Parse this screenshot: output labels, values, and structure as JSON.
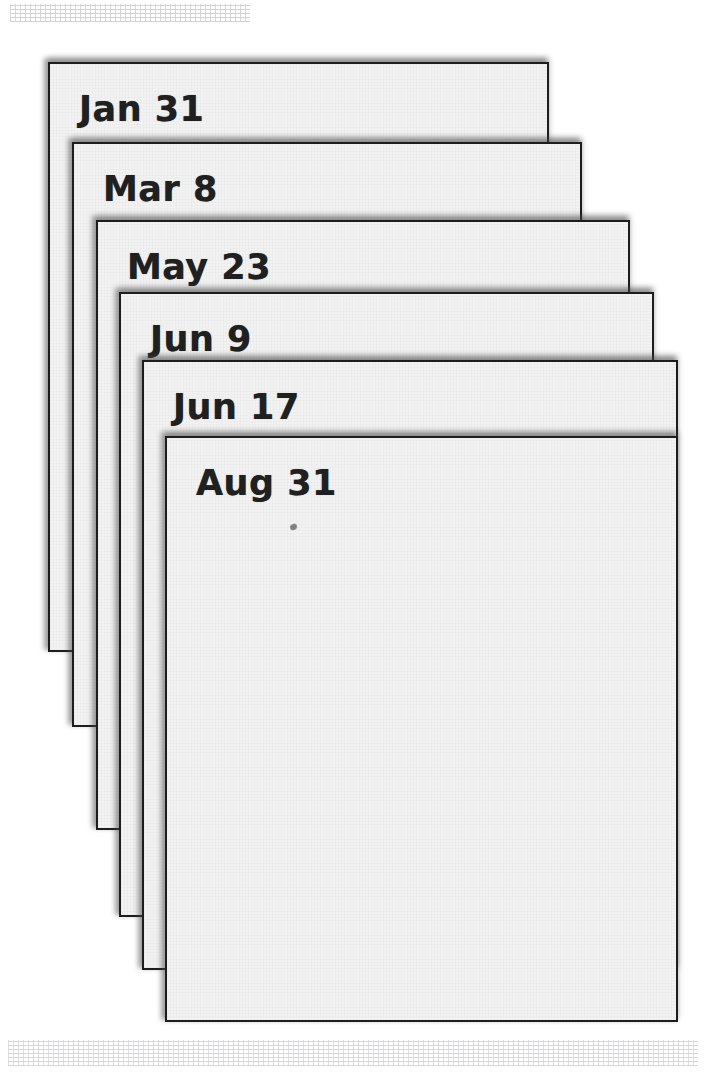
{
  "page": {
    "background_color": "#ffffff",
    "width": 715,
    "height": 1081
  },
  "style": {
    "card_fill": "#f2f2f2",
    "card_border_color": "#1d1d1d",
    "label_color": "#202020",
    "shadow_color": "#464646"
  },
  "stack": {
    "count": 6,
    "cards": [
      {
        "label": "Jan 31",
        "z": 1,
        "left": 48,
        "top": 62,
        "width": 501,
        "height": 590
      },
      {
        "label": "Mar 8",
        "z": 2,
        "left": 72,
        "top": 142,
        "width": 510,
        "height": 585
      },
      {
        "label": "May 23",
        "z": 3,
        "left": 96,
        "top": 220,
        "width": 534,
        "height": 610
      },
      {
        "label": "Jun 9",
        "z": 4,
        "left": 119,
        "top": 292,
        "width": 535,
        "height": 625
      },
      {
        "label": "Jun 17",
        "z": 5,
        "left": 142,
        "top": 360,
        "width": 536,
        "height": 610
      },
      {
        "label": "Aug 31",
        "z": 6,
        "left": 165,
        "top": 436,
        "width": 513,
        "height": 586
      }
    ]
  },
  "artifacts": {
    "ink_speck": {
      "left": 290,
      "top": 524
    }
  }
}
